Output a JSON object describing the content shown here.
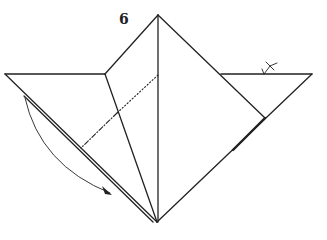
{
  "diagram": {
    "type": "origami-instruction",
    "step_number": "6",
    "symbols": [
      {
        "name": "valley-fold-line",
        "style": "dotted"
      },
      {
        "name": "mountain-fold-line",
        "style": "dash-dot"
      },
      {
        "name": "fold-arrow",
        "direction": "down-right"
      },
      {
        "name": "turn-over-symbol"
      }
    ],
    "colors": {
      "line": "#222222",
      "background": "#ffffff"
    }
  }
}
